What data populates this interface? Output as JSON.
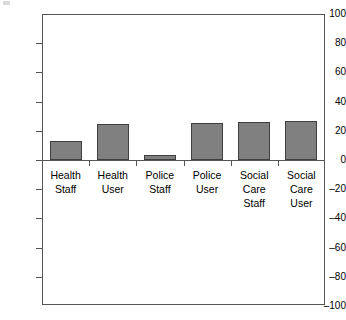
{
  "chart_data": {
    "type": "bar",
    "title": "",
    "subtitle": "",
    "xlabel": "",
    "ylabel": "",
    "categories": [
      "Health\nStaff",
      "Health\nUser",
      "Police\nStaff",
      "Police\nUser",
      "Social\nCare\nStaff",
      "Social\nCare\nUser"
    ],
    "category_lines": [
      [
        "Health",
        "Staff"
      ],
      [
        "Health",
        "User"
      ],
      [
        "Police",
        "Staff"
      ],
      [
        "Police",
        "User"
      ],
      [
        "Social",
        "Care",
        "Staff"
      ],
      [
        "Social",
        "Care",
        "User"
      ]
    ],
    "values": [
      13,
      25,
      3.5,
      25.5,
      26,
      26.5
    ],
    "ylim": [
      -100,
      100
    ],
    "yticks": [
      100,
      80,
      60,
      40,
      20,
      0,
      -20,
      -40,
      -60,
      -80,
      -100
    ],
    "ytick_labels": [
      "100",
      "80",
      "60",
      "40",
      "20",
      "0",
      "–20",
      "–40",
      "–60",
      "–80",
      "–100"
    ],
    "grid": false,
    "legend": null,
    "bar_color": "#808080",
    "bar_border_color": "#3f3f3f",
    "axis_color": "#555555",
    "background": "#ffffff"
  }
}
